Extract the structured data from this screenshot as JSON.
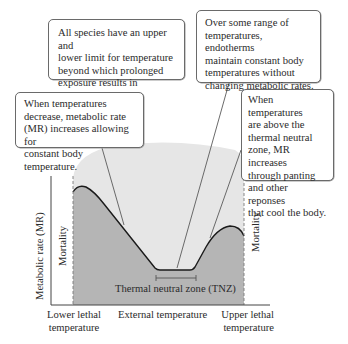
{
  "figure": {
    "colors": {
      "background_region": "#e6e6e6",
      "mortality_region": "#b5b5b5",
      "curve": "#1a1a1a",
      "leader_line": "#5a5a5a",
      "box_border": "#6a6a6a",
      "text": "#2b2b2b"
    },
    "callouts": [
      {
        "id": "lethal-limits",
        "text": "All species have an upper and\nlower limit for temperature\nbeyond which prolonged\nexposure results in mortality."
      },
      {
        "id": "tnz-constant",
        "text": "Over some range of\ntemperatures, endotherms\nmaintain constant body\ntemperatures without\nchanging metabolic rates."
      },
      {
        "id": "cold-response",
        "text": "When temperatures\ndecrease, metabolic rate\n(MR) increases allowing for\nconstant body temperature."
      },
      {
        "id": "heat-response",
        "text": "When temperatures\nare above the\nthermal neutral\nzone, MR increases\nthrough panting\nand other reponses\nthat cool the body."
      }
    ],
    "y_axis_label": "Metabolic rate (MR)",
    "x_axis_label": "External temperature",
    "x_left_label": "Lower lethal\ntemperature",
    "x_right_label": "Upper lethal\ntemperature",
    "mortality_left": "Mortality",
    "mortality_right": "Mortality",
    "tnz_label": "Thermal neutral zone (TNZ)"
  }
}
